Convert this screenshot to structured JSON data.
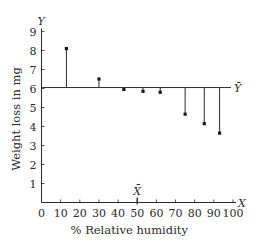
{
  "chart_data": {
    "type": "scatter",
    "subtype": "residual-lollipop",
    "title": "",
    "xlabel": "% Relative humidity",
    "ylabel": "Weight loss in mg",
    "x_axis_letter": "X",
    "y_axis_letter": "Y",
    "mean_x_label": "X̄",
    "mean_y_label": "Ȳ",
    "xlim": [
      0,
      100
    ],
    "ylim": [
      0,
      9
    ],
    "x_ticks": [
      0,
      10,
      20,
      30,
      40,
      50,
      60,
      70,
      80,
      90,
      100
    ],
    "y_ticks": [
      1,
      2,
      3,
      4,
      5,
      6,
      7,
      8,
      9
    ],
    "grid": false,
    "legend": null,
    "mean_x": 50,
    "mean_y": 6.05,
    "points": [
      {
        "x": 13,
        "y": 8.1
      },
      {
        "x": 30,
        "y": 6.5
      },
      {
        "x": 43,
        "y": 5.95
      },
      {
        "x": 53,
        "y": 5.85
      },
      {
        "x": 62,
        "y": 5.8
      },
      {
        "x": 75,
        "y": 4.65
      },
      {
        "x": 85,
        "y": 4.15
      },
      {
        "x": 93,
        "y": 3.65
      }
    ],
    "annotations": [
      "Vertical segments connect each point to the horizontal mean line Ȳ",
      "Mean X̄ marked on x-axis at 50"
    ]
  }
}
